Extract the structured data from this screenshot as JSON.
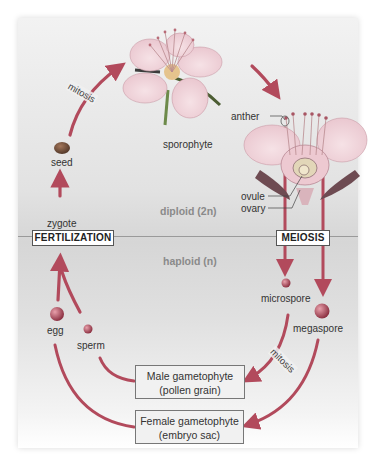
{
  "diagram": {
    "colors": {
      "arrow": "#b24a5c",
      "flower_petal": "#f3d6dc",
      "flower_center": "#e7b7c2",
      "spore": "#a54454",
      "panel": "#dcdcdc",
      "divider": "#9a9a9a",
      "ploidy_text": "#8a8a8a"
    },
    "zones": {
      "diploid_label": "diploid (2n)",
      "haploid_label": "haploid (n)"
    },
    "stages": {
      "fertilization": "FERTILIZATION",
      "meiosis": "MEIOSIS"
    },
    "nodes": {
      "sporophyte": "sporophyte",
      "seed": "seed",
      "zygote": "zygote",
      "egg": "egg",
      "sperm": "sperm",
      "microspore": "microspore",
      "megaspore": "megaspore"
    },
    "flower_parts": {
      "anther": "anther",
      "ovule": "ovule",
      "ovary": "ovary"
    },
    "processes": {
      "mitosis_top": "mitosis",
      "mitosis_bottom": "mitosis"
    },
    "gametophytes": {
      "male_line1": "Male gametophyte",
      "male_line2": "(pollen grain)",
      "female_line1": "Female gametophyte",
      "female_line2": "(embryo sac)"
    }
  }
}
